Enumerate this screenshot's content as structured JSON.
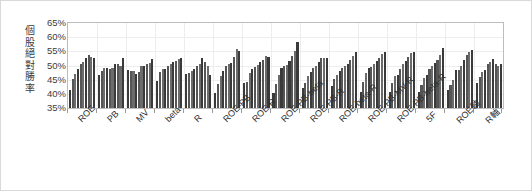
{
  "chart_data": {
    "type": "bar",
    "title": "",
    "subtitle": "",
    "xlabel": "",
    "ylabel": "個股絕對勝率",
    "ylim": [
      0.35,
      0.65
    ],
    "ytick_labels": [
      "65%",
      "60%",
      "55%",
      "50%",
      "45%",
      "40%",
      "35%"
    ],
    "ytick_values": [
      0.65,
      0.6,
      0.55,
      0.5,
      0.45,
      0.4,
      0.35
    ],
    "grid": true,
    "legend": "none",
    "legend_position": "none",
    "value_format": "percent",
    "bars_per_group": 10,
    "categories": [
      "ROE",
      "PB",
      "MV",
      "beta",
      "R",
      "ROE-PB",
      "ROE-R",
      "ROE-PB-beta",
      "ROE-PB-R",
      "ROE-beta-R",
      "ROE-PB-MV-R",
      "ROE-PB-beta-R",
      "5F",
      "ROE軸",
      "R軸"
    ],
    "groups": [
      {
        "category": "ROE",
        "values": [
          0.412,
          0.452,
          0.471,
          0.489,
          0.505,
          0.512,
          0.528,
          0.536,
          0.53,
          0.528
        ]
      },
      {
        "category": "PB",
        "values": [
          0.468,
          0.48,
          0.492,
          0.49,
          0.486,
          0.492,
          0.504,
          0.507,
          0.5,
          0.528
        ]
      },
      {
        "category": "MV",
        "values": [
          0.484,
          0.481,
          0.479,
          0.47,
          0.478,
          0.497,
          0.5,
          0.506,
          0.508,
          0.522
        ]
      },
      {
        "category": "beta",
        "values": [
          0.446,
          0.478,
          0.488,
          0.486,
          0.497,
          0.504,
          0.512,
          0.515,
          0.524,
          0.528
        ]
      },
      {
        "category": "R",
        "values": [
          0.47,
          0.474,
          0.481,
          0.486,
          0.497,
          0.506,
          0.527,
          0.514,
          0.498,
          0.468
        ]
      },
      {
        "category": "ROE-PB",
        "values": [
          0.404,
          0.434,
          0.462,
          0.482,
          0.498,
          0.504,
          0.51,
          0.53,
          0.558,
          0.552
        ]
      },
      {
        "category": "ROE-R",
        "values": [
          0.437,
          0.441,
          0.473,
          0.489,
          0.496,
          0.502,
          0.514,
          0.518,
          0.534,
          0.53
        ]
      },
      {
        "category": "ROE-PB-beta",
        "values": [
          0.402,
          0.434,
          0.466,
          0.492,
          0.5,
          0.502,
          0.516,
          0.534,
          0.551,
          0.584
        ]
      },
      {
        "category": "ROE-PB-R",
        "values": [
          0.42,
          0.438,
          0.462,
          0.478,
          0.492,
          0.5,
          0.512,
          0.528,
          0.528,
          0.526
        ]
      },
      {
        "category": "ROE-beta-R",
        "values": [
          0.428,
          0.454,
          0.468,
          0.48,
          0.49,
          0.498,
          0.506,
          0.52,
          0.532,
          0.548
        ]
      },
      {
        "category": "ROE-PB-MV-R",
        "values": [
          0.408,
          0.441,
          0.474,
          0.49,
          0.496,
          0.506,
          0.516,
          0.528,
          0.54,
          0.548
        ]
      },
      {
        "category": "ROE-PB-beta-R",
        "values": [
          0.407,
          0.44,
          0.462,
          0.468,
          0.486,
          0.504,
          0.516,
          0.53,
          0.544,
          0.548
        ]
      },
      {
        "category": "5F",
        "values": [
          0.405,
          0.43,
          0.456,
          0.466,
          0.488,
          0.5,
          0.508,
          0.52,
          0.536,
          0.562
        ]
      },
      {
        "category": "ROE軸",
        "values": [
          0.412,
          0.432,
          0.45,
          0.483,
          0.484,
          0.5,
          0.518,
          0.536,
          0.548,
          0.556
        ]
      },
      {
        "category": "R軸",
        "values": [
          0.44,
          0.46,
          0.478,
          0.484,
          0.506,
          0.512,
          0.524,
          0.506,
          0.5,
          0.506
        ]
      }
    ]
  }
}
